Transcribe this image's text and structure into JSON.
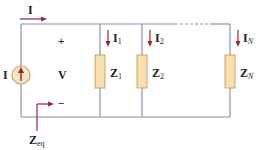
{
  "diagram": {
    "colors": {
      "wire": "#8c8fb0",
      "arrow": "#9b2335",
      "resistor_fill": "#f7dfae",
      "resistor_stroke": "#c9a46a",
      "source_fill": "#fbe6c4",
      "source_stroke": "#c9a46a",
      "text": "#231f20"
    },
    "labels": {
      "input_current": "I",
      "source_current": "I",
      "voltage": "V",
      "plus": "+",
      "minus": "−",
      "branch_1_current": "I",
      "branch_1_current_sub": "1",
      "branch_2_current": "I",
      "branch_2_current_sub": "2",
      "branch_n_current": "I",
      "branch_n_current_sub": "N",
      "z1": "Z",
      "z1_sub": "1",
      "z2": "Z",
      "z2_sub": "2",
      "zn": "Z",
      "zn_sub": "N",
      "zeq": "Z",
      "zeq_sub": "eq"
    },
    "components": [
      {
        "id": "source",
        "type": "current-source",
        "direction": "up"
      },
      {
        "id": "Z1",
        "type": "impedance"
      },
      {
        "id": "Z2",
        "type": "impedance"
      },
      {
        "id": "ZN",
        "type": "impedance"
      }
    ],
    "dashed_segment": "between Z2 and ZN on top wire"
  }
}
